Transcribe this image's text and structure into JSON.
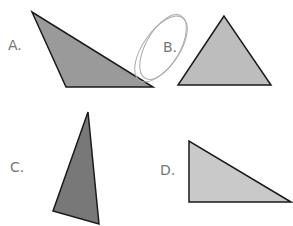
{
  "figure": {
    "options": [
      {
        "label": "A.",
        "shape": "obtuse-triangle",
        "fill": "#9a9a9a",
        "points": "32,12 66,87 153,87"
      },
      {
        "label": "B.",
        "shape": "equilateral-triangle",
        "fill": "#bdbdbd",
        "points": "224,16 178,85 271,85",
        "circled": true
      },
      {
        "label": "C.",
        "shape": "acute-scalene-triangle",
        "fill": "#787878",
        "points": "88,112 53,211 99,224"
      },
      {
        "label": "D.",
        "shape": "right-triangle",
        "fill": "#c9c9c9",
        "points": "189,141 189,202 291,202"
      }
    ],
    "stroke": "#1a1a1a"
  }
}
